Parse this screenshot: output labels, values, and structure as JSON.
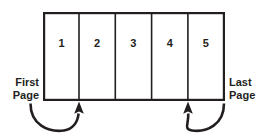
{
  "diagram": {
    "type": "page-range",
    "colors": {
      "line": "#231f20",
      "fill": "#ffffff",
      "background": "#ffffff"
    },
    "page_box": {
      "name": "page-range-box",
      "cells": [
        {
          "label": "1",
          "name": "page-cell-1"
        },
        {
          "label": "2",
          "name": "page-cell-2"
        },
        {
          "label": "3",
          "name": "page-cell-3"
        },
        {
          "label": "4",
          "name": "page-cell-4"
        },
        {
          "label": "5",
          "name": "page-cell-5"
        }
      ]
    },
    "annotations": {
      "first": {
        "line1": "First",
        "line2": "Page"
      },
      "last": {
        "line1": "Last",
        "line2": "Page"
      }
    },
    "arrows": [
      {
        "name": "first-page-arrow",
        "direction": "up",
        "from": "First Page label",
        "to": "page-cell-1 right edge"
      },
      {
        "name": "last-page-arrow",
        "direction": "up",
        "from": "Last Page label",
        "to": "page-cell-5 left edge"
      }
    ]
  }
}
